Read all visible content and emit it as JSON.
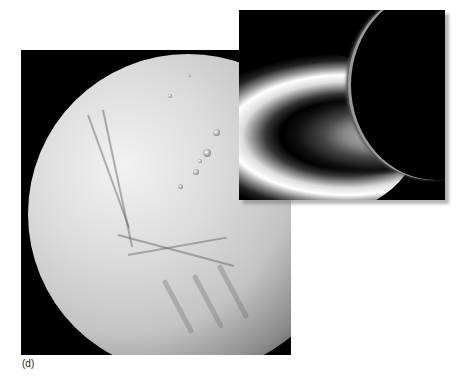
{
  "figure": {
    "panel_label": "(d)",
    "main_image": {
      "subject": "icy moon surface with fractures and craters",
      "background_color": "#000000"
    },
    "inset_image": {
      "subject": "backlit moon crescent with plume",
      "background_color": "#000000"
    }
  }
}
